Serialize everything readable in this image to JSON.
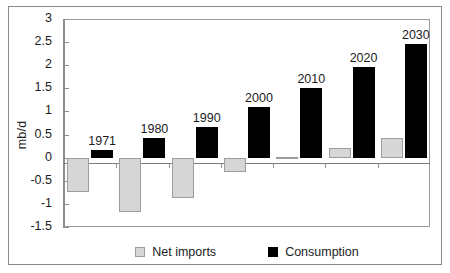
{
  "chart_data": {
    "type": "bar",
    "title": "",
    "xlabel": "",
    "ylabel": "mb/d",
    "ylim": [
      -1.5,
      3
    ],
    "ytick_labels": [
      "3",
      "2.5",
      "2",
      "1.5",
      "1",
      "0.5",
      "0",
      "-0.5",
      "-1",
      "-1.5"
    ],
    "ytick_values": [
      3,
      2.5,
      2,
      1.5,
      1,
      0.5,
      0,
      -0.5,
      -1,
      -1.5
    ],
    "grid": false,
    "legend_position": "bottom",
    "categories": [
      "1971",
      "1980",
      "1990",
      "2000",
      "2010",
      "2020",
      "2030"
    ],
    "series": [
      {
        "name": "Net imports",
        "color": "#d6d6d6",
        "values": [
          -0.75,
          -1.18,
          -0.87,
          -0.3,
          0.02,
          0.2,
          0.42
        ]
      },
      {
        "name": "Consumption",
        "color": "#000000",
        "values": [
          0.17,
          0.43,
          0.67,
          1.1,
          1.5,
          1.97,
          2.45
        ]
      }
    ],
    "point_labels": [
      "1971",
      "1980",
      "1990",
      "2000",
      "2010",
      "2020",
      "2030"
    ]
  },
  "legend": {
    "items": [
      {
        "label": "Net imports",
        "swatch": "gray-square-icon"
      },
      {
        "label": "Consumption",
        "swatch": "black-square-icon"
      }
    ]
  }
}
